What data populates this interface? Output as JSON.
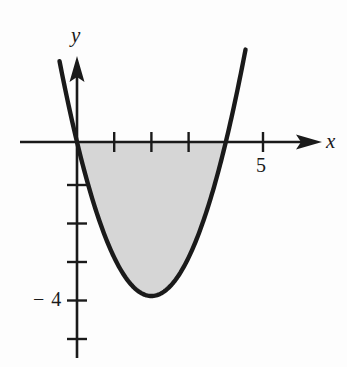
{
  "figure": {
    "title": "",
    "background_color": "#fdfdfd",
    "ink_color": "#1a1a1a",
    "shade_color": "#d6d6d6"
  },
  "axis_labels": {
    "x": "x",
    "y": "y"
  },
  "tick_labels": {
    "x_five": "5",
    "y_neg_four": "− 4"
  },
  "chart_data": {
    "type": "line",
    "title": "",
    "subtitle": "",
    "xlabel": "x",
    "ylabel": "y",
    "grid": false,
    "legend": null,
    "xlim": [
      -1.55,
      6.55
    ],
    "ylim": [
      -5.85,
      2.2
    ],
    "x_ticks": [
      1,
      2,
      3,
      4,
      5
    ],
    "x_tick_labels": [
      "",
      "",
      "",
      "",
      "5"
    ],
    "y_ticks": [
      -1,
      -2,
      -3,
      -4,
      -5
    ],
    "y_tick_labels": [
      "",
      "",
      "",
      "− 4",
      ""
    ],
    "series": [
      {
        "name": "y = x^2 - 4x",
        "type": "line",
        "equation": "y = x^2 - 4x",
        "vertex": [
          2,
          -4
        ],
        "roots": [
          0,
          4
        ],
        "x_range": [
          -0.47,
          4.53
        ],
        "x": [
          -0.47,
          -0.25,
          0,
          0.25,
          0.5,
          0.75,
          1,
          1.25,
          1.5,
          1.75,
          2,
          2.25,
          2.5,
          2.75,
          3,
          3.25,
          3.5,
          3.75,
          4,
          4.25,
          4.53
        ],
        "values": [
          2.1,
          1.06,
          0,
          -0.94,
          -1.75,
          -2.44,
          -3,
          -3.44,
          -3.75,
          -3.94,
          -4,
          -3.94,
          -3.75,
          -3.44,
          -3,
          -2.44,
          -1.75,
          -0.94,
          0,
          1.06,
          2.4
        ]
      }
    ],
    "shaded_region": {
      "label": "area between curve and x-axis",
      "upper_bound": "y = 0",
      "lower_bound": "y = x^2 - 4x",
      "x_from": 0,
      "x_to": 4,
      "color": "#d6d6d6"
    },
    "annotations": []
  }
}
